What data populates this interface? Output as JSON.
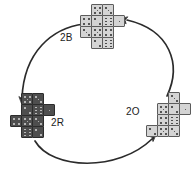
{
  "figure": {
    "type": "cycle-diagram",
    "background": "#ffffff",
    "width": 195,
    "height": 181,
    "colors": {
      "light_die_fill": "#d4d4d4",
      "light_die_stroke": "#5c5c5c",
      "dark_die_fill": "#4e4e4e",
      "dark_die_stroke": "#2c2c2c",
      "arrow": "#2b2b2b",
      "text": "#1c1c1c"
    }
  },
  "labels": {
    "top": "2B",
    "left": "2R",
    "right": "2O"
  },
  "clusters": [
    {
      "id": "top",
      "name": "cluster-2B",
      "label": "2B",
      "shade": "light",
      "origin": {
        "x": 80,
        "y": 4
      },
      "cell": 11,
      "dice": [
        {
          "col": 1,
          "row": 0,
          "pips": 5
        },
        {
          "col": 2,
          "row": 0,
          "pips": 3
        },
        {
          "col": 0,
          "row": 1,
          "pips": 4
        },
        {
          "col": 1,
          "row": 1,
          "pips": 2
        },
        {
          "col": 2,
          "row": 1,
          "pips": 6
        },
        {
          "col": 3,
          "row": 1,
          "pips": 1
        },
        {
          "col": 0,
          "row": 2,
          "pips": 3
        },
        {
          "col": 1,
          "row": 2,
          "pips": 5
        },
        {
          "col": 2,
          "row": 2,
          "pips": 4
        },
        {
          "col": 1,
          "row": 3,
          "pips": 2
        },
        {
          "col": 2,
          "row": 3,
          "pips": 6
        }
      ]
    },
    {
      "id": "left",
      "name": "cluster-2R",
      "label": "2R",
      "shade": "dark",
      "origin": {
        "x": 10,
        "y": 93
      },
      "cell": 11,
      "dice": [
        {
          "col": 1,
          "row": 0,
          "pips": 5
        },
        {
          "col": 2,
          "row": 0,
          "pips": 3
        },
        {
          "col": 1,
          "row": 1,
          "pips": 2
        },
        {
          "col": 2,
          "row": 1,
          "pips": 6
        },
        {
          "col": 3,
          "row": 1,
          "pips": 1
        },
        {
          "col": 0,
          "row": 2,
          "pips": 4
        },
        {
          "col": 1,
          "row": 2,
          "pips": 5
        },
        {
          "col": 2,
          "row": 2,
          "pips": 3
        },
        {
          "col": 1,
          "row": 3,
          "pips": 6
        },
        {
          "col": 2,
          "row": 3,
          "pips": 2
        }
      ]
    },
    {
      "id": "right",
      "name": "cluster-2O",
      "label": "2O",
      "shade": "light",
      "origin": {
        "x": 146,
        "y": 92
      },
      "cell": 11,
      "dice": [
        {
          "col": 2,
          "row": 0,
          "pips": 3
        },
        {
          "col": 1,
          "row": 1,
          "pips": 5
        },
        {
          "col": 2,
          "row": 1,
          "pips": 2
        },
        {
          "col": 3,
          "row": 1,
          "pips": 1
        },
        {
          "col": 1,
          "row": 2,
          "pips": 4
        },
        {
          "col": 2,
          "row": 2,
          "pips": 6
        },
        {
          "col": 0,
          "row": 3,
          "pips": 2
        },
        {
          "col": 1,
          "row": 3,
          "pips": 5
        },
        {
          "col": 2,
          "row": 3,
          "pips": 3
        }
      ]
    }
  ],
  "arrows": [
    {
      "id": "arrow-2B-to-2R",
      "from": "2B",
      "to": "2R",
      "path": "M 84 24 C 52 28, 24 52, 22 98",
      "head": {
        "x": 22,
        "y": 104,
        "angle": 95
      }
    },
    {
      "id": "arrow-2R-to-2O",
      "from": "2R",
      "to": "2O",
      "path": "M 35 141 C 52 170, 118 172, 152 139",
      "head": {
        "x": 156,
        "y": 134,
        "angle": -41
      }
    },
    {
      "id": "arrow-2O-to-2B",
      "from": "2O",
      "to": "2B",
      "path": "M 167 96 C 182 64, 170 30, 127 20",
      "head": {
        "x": 120,
        "y": 19,
        "angle": 192
      }
    }
  ],
  "label_positions": {
    "top": {
      "x": 60,
      "y": 33
    },
    "left": {
      "x": 51,
      "y": 118
    },
    "right": {
      "x": 126,
      "y": 107
    }
  }
}
